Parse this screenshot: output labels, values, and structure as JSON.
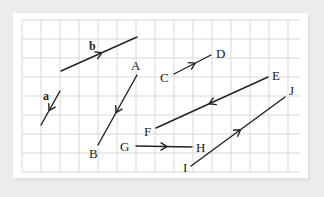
{
  "diagram": {
    "type": "vectors-on-grid",
    "colors": {
      "background": "#ececec",
      "paper": "#ffffff",
      "grid": "#d9d9d9",
      "ink": "#222222"
    },
    "grid": {
      "x0": 22,
      "y0": 20,
      "x1": 300,
      "y1": 172,
      "spacing": 19
    },
    "vectors": [
      {
        "id": "b",
        "label": "b",
        "bold": true,
        "from": [
          61,
          71
        ],
        "to": [
          137,
          37
        ],
        "arrow_dir": "forward",
        "label_pos": [
          89,
          50
        ]
      },
      {
        "id": "a",
        "label": "a",
        "bold": true,
        "from": [
          60,
          91
        ],
        "to": [
          41,
          125
        ],
        "arrow_dir": "forward",
        "label_pos": [
          43,
          100
        ]
      },
      {
        "id": "AB",
        "from": [
          137,
          75
        ],
        "to": [
          98,
          145
        ],
        "arrow_dir": "forward",
        "start_label": "A",
        "start_label_pos": [
          131,
          70
        ],
        "end_label": "B",
        "end_label_pos": [
          89,
          158
        ]
      },
      {
        "id": "CD",
        "from": [
          174,
          74
        ],
        "to": [
          211,
          55
        ],
        "arrow_dir": "forward",
        "start_label": "C",
        "start_label_pos": [
          160,
          82
        ],
        "end_label": "D",
        "end_label_pos": [
          216,
          58
        ]
      },
      {
        "id": "EF",
        "from": [
          268,
          77
        ],
        "to": [
          156,
          128
        ],
        "arrow_dir": "forward",
        "start_label": "E",
        "start_label_pos": [
          272,
          80
        ],
        "end_label": "F",
        "end_label_pos": [
          144,
          136
        ]
      },
      {
        "id": "GH",
        "from": [
          136,
          146
        ],
        "to": [
          192,
          147
        ],
        "arrow_dir": "forward",
        "start_label": "G",
        "start_label_pos": [
          120,
          151
        ],
        "end_label": "H",
        "end_label_pos": [
          196,
          152
        ]
      },
      {
        "id": "IJ",
        "from": [
          191,
          166
        ],
        "to": [
          285,
          97
        ],
        "arrow_dir": "forward",
        "start_label": "I",
        "start_label_pos": [
          183,
          172
        ],
        "end_label": "J",
        "end_label_pos": [
          289,
          95
        ]
      }
    ]
  }
}
